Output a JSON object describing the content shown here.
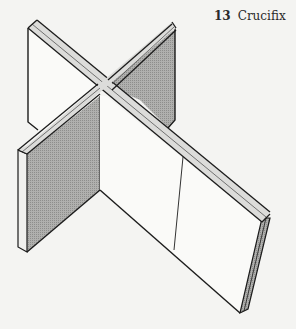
{
  "caption": {
    "number": "13",
    "title": "Crucifix"
  },
  "colors": {
    "background": "#f4f4f2",
    "panel_face_light": "#fafaf8",
    "panel_face_shaded": "#a9a9a7",
    "panel_edge": "#dcdcda",
    "outline": "#1c1c1c"
  },
  "figure": {
    "panels": [
      "back-left",
      "back-right",
      "front-left",
      "front-right"
    ]
  }
}
